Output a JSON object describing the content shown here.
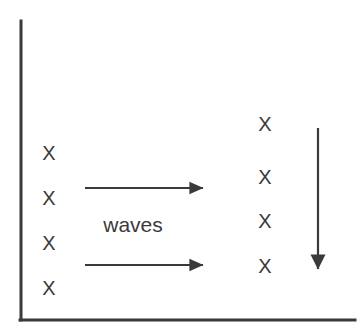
{
  "figure": {
    "type": "line-diagram",
    "background_color": "#ffffff",
    "stroke_color": "#3a3a3a",
    "width": 363,
    "height": 333
  },
  "axes": {
    "name": "l-shaped-axis-frame",
    "vertical_axis": {
      "x": 21,
      "y_top": 21,
      "y_bottom": 320
    },
    "horizontal_axis": {
      "y": 320,
      "x_left": 21,
      "x_right": 355
    },
    "line_width": 3
  },
  "marks": {
    "glyph": "X",
    "left_column": {
      "label": "left-x-column",
      "x": 49,
      "items": [
        {
          "glyph": "X",
          "y": 153
        },
        {
          "glyph": "X",
          "y": 198
        },
        {
          "glyph": "X",
          "y": 243
        },
        {
          "glyph": "X",
          "y": 288
        }
      ]
    },
    "right_column": {
      "label": "right-x-column",
      "x": 265,
      "items": [
        {
          "glyph": "X",
          "y": 124
        },
        {
          "glyph": "X",
          "y": 177
        },
        {
          "glyph": "X",
          "y": 221
        },
        {
          "glyph": "X",
          "y": 266
        }
      ]
    }
  },
  "arrows": {
    "horizontal": [
      {
        "name": "waves-arrow-upper",
        "x_start": 85,
        "x_end": 209,
        "y": 188
      },
      {
        "name": "waves-arrow-lower",
        "x_start": 85,
        "x_end": 209,
        "y": 265
      }
    ],
    "vertical": [
      {
        "name": "downward-arrow",
        "x": 318,
        "y_start": 128,
        "y_end": 277
      }
    ]
  },
  "labels": {
    "waves": {
      "text": "waves",
      "x": 133,
      "y": 224
    }
  }
}
